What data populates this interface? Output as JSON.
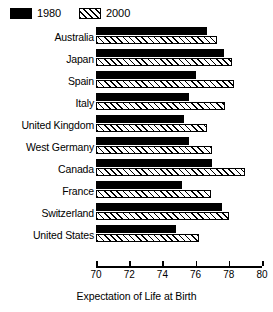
{
  "chart_data": {
    "type": "bar",
    "orientation": "horizontal",
    "title": "",
    "xlabel": "Expectation of Life at Birth",
    "ylabel": "",
    "xlim": [
      70,
      80
    ],
    "xticks": [
      70,
      72,
      74,
      76,
      78,
      80
    ],
    "grid": false,
    "legend_position": "top-left",
    "categories": [
      "Australia",
      "Japan",
      "Spain",
      "Italy",
      "United Kingdom",
      "West Germany",
      "Canada",
      "France",
      "Switzerland",
      "United States"
    ],
    "series": [
      {
        "name": "1980",
        "color": "#000000",
        "pattern": "solid",
        "values": [
          76.7,
          77.7,
          76.0,
          75.6,
          75.3,
          75.6,
          77.0,
          75.2,
          77.6,
          74.8
        ]
      },
      {
        "name": "2000",
        "color": "#000000",
        "pattern": "diagonal-hatch",
        "values": [
          77.3,
          78.2,
          78.3,
          77.8,
          76.7,
          77.0,
          79.0,
          76.9,
          78.0,
          76.2
        ]
      }
    ]
  },
  "legend": {
    "entries": [
      {
        "label": "1980",
        "swatch": "solid-black-swatch"
      },
      {
        "label": "2000",
        "swatch": "hatched-swatch"
      }
    ]
  }
}
